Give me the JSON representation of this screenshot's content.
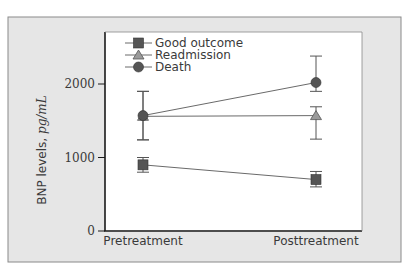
{
  "chart_data": {
    "type": "line",
    "title": "",
    "xlabel": "",
    "ylabel": "BNP levels,",
    "ylabel_unit": "pg/mL",
    "categories": [
      "Pretreatment",
      "Posttreatment"
    ],
    "ylim": [
      0,
      2400
    ],
    "yticks": [
      0,
      1000,
      2000
    ],
    "ytick_labels": [
      "0",
      "1000",
      "2000"
    ],
    "grid": false,
    "legend_position": "top-left inside",
    "series": [
      {
        "name": "Good outcome",
        "marker": "square",
        "values": [
          900,
          700
        ],
        "error_low": [
          800,
          600
        ],
        "error_high": [
          1000,
          810
        ]
      },
      {
        "name": "Readmission",
        "marker": "triangle",
        "values": [
          1560,
          1570
        ],
        "error_low": [
          1240,
          1250
        ],
        "error_high": [
          1900,
          1690
        ]
      },
      {
        "name": "Death",
        "marker": "circle",
        "values": [
          1570,
          2020
        ],
        "error_low": [
          1240,
          1900
        ],
        "error_high": [
          1900,
          2380
        ]
      }
    ]
  },
  "colors": {
    "frame_bg": "#e6e6e6",
    "frame_border": "#8a8a8a",
    "plot_bg": "#ffffff",
    "axis": "#1a1a1a",
    "marker": "#555555",
    "line": "#6a6a6a"
  }
}
